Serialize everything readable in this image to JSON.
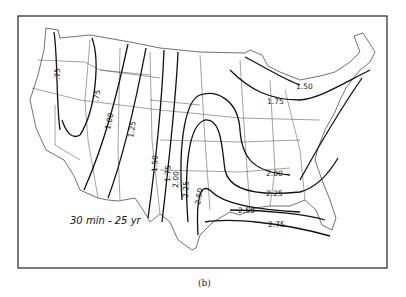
{
  "figure": {
    "title": "30 min - 25 yr",
    "caption": "(b)"
  },
  "isolines": {
    "unit": "inches",
    "labels": [
      {
        "id": "w1",
        "value": ".75"
      },
      {
        "id": "w2",
        "value": ".75"
      },
      {
        "id": "a",
        "value": "1.00"
      },
      {
        "id": "b",
        "value": "1.25"
      },
      {
        "id": "c",
        "value": "1.50"
      },
      {
        "id": "d",
        "value": "1.75"
      },
      {
        "id": "e",
        "value": "2.00"
      },
      {
        "id": "f",
        "value": "2.25"
      },
      {
        "id": "g",
        "value": "2.50"
      },
      {
        "id": "ne1",
        "value": "1.50"
      },
      {
        "id": "ne2",
        "value": "1.75"
      },
      {
        "id": "se1",
        "value": "2.00"
      },
      {
        "id": "se2",
        "value": "2.25"
      },
      {
        "id": "se3",
        "value": "2.50"
      },
      {
        "id": "se4",
        "value": "2.75"
      }
    ]
  }
}
